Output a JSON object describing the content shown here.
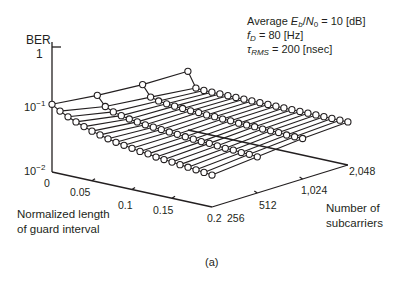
{
  "chart_data": {
    "type": "surface3d",
    "title": "",
    "caption": "(a)",
    "zlabel": "BER",
    "xlabel": "Normalized length of guard interval",
    "ylabel": "Number of subcarriers",
    "z_scale": "log",
    "zlim": [
      0.01,
      1
    ],
    "z_ticks": [
      "1",
      "10^-1",
      "10^-2"
    ],
    "x_ticks": [
      "0",
      "0.05",
      "0.1",
      "0.15",
      "0.2"
    ],
    "y_ticks": [
      "256",
      "512",
      "1,024",
      "2,048"
    ],
    "annotations": [
      "Average Eb/N0 = 10 [dB]",
      "fD = 80 [Hz]",
      "τRMS = 200 [nsec]"
    ],
    "x": [
      0,
      0.01,
      0.02,
      0.03,
      0.04,
      0.05,
      0.06,
      0.07,
      0.08,
      0.09,
      0.1,
      0.11,
      0.12,
      0.13,
      0.14,
      0.15,
      0.16,
      0.17,
      0.18,
      0.19,
      0.2
    ],
    "y": [
      256,
      512,
      1024,
      2048
    ],
    "series": [
      {
        "name": "256",
        "values": [
          0.11,
          0.092,
          0.08,
          0.071,
          0.064,
          0.058,
          0.054,
          0.05,
          0.047,
          0.045,
          0.043,
          0.041,
          0.04,
          0.038,
          0.037,
          0.036,
          0.035,
          0.034,
          0.033,
          0.032,
          0.031
        ]
      },
      {
        "name": "512",
        "values": [
          0.092,
          0.066,
          0.058,
          0.054,
          0.051,
          0.049,
          0.047,
          0.046,
          0.045,
          0.044,
          0.043,
          0.042,
          0.041,
          0.04,
          0.04,
          0.039,
          0.038,
          0.038,
          0.037,
          0.037,
          0.036
        ]
      },
      {
        "name": "1024",
        "values": [
          0.082,
          0.056,
          0.052,
          0.05,
          0.049,
          0.048,
          0.047,
          0.047,
          0.046,
          0.046,
          0.045,
          0.045,
          0.044,
          0.044,
          0.044,
          0.043,
          0.043,
          0.043,
          0.042,
          0.042,
          0.042
        ]
      },
      {
        "name": "2048",
        "values": [
          0.08,
          0.047,
          0.046,
          0.046,
          0.046,
          0.046,
          0.046,
          0.046,
          0.046,
          0.046,
          0.046,
          0.046,
          0.046,
          0.046,
          0.046,
          0.046,
          0.046,
          0.046,
          0.046,
          0.046,
          0.046
        ]
      }
    ]
  },
  "labels": {
    "ber": "BER",
    "z_one": "1",
    "z_base": "10",
    "z_exp1": "−1",
    "z_exp2": "−2",
    "x_title_1": "Normalized length",
    "x_title_2": "of guard interval",
    "y_title_1": "Number of",
    "y_title_2": "subcarriers",
    "x_tick_0": "0",
    "x_tick_1": "0.05",
    "x_tick_2": "0.1",
    "x_tick_3": "0.15",
    "x_tick_4": "0.2",
    "y_tick_0": "256",
    "y_tick_1": "512",
    "y_tick_2": "1,024",
    "y_tick_3": "2,048",
    "caption": "(a)"
  },
  "params": {
    "line1_prefix": "Average ",
    "line1_E": "E",
    "line1_Esub": "b",
    "line1_slash": "/",
    "line1_N": "N",
    "line1_Nsub": "0",
    "line1_value": " = 10 [dB]",
    "line2_f": "f",
    "line2_fsub": "D",
    "line2_value": " = 80 [Hz]",
    "line3_tau": "τ",
    "line3_tausub": "RMS",
    "line3_value": " = 200 [nsec]"
  },
  "colors": {
    "ink": "#231f20",
    "marker_fill": "#ffffff"
  }
}
